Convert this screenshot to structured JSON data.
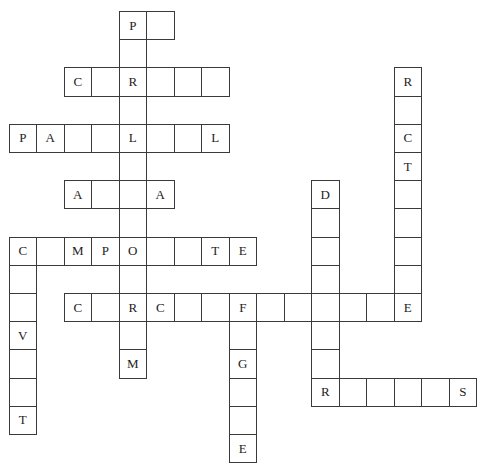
{
  "puzzle": {
    "type": "crossword",
    "grid_origin": {
      "x": 8.5,
      "y": 11
    },
    "cell_pitch": {
      "x": 27.5,
      "y": 28.2
    },
    "colors": {
      "border": "#3a3a3a",
      "text": "#222222",
      "background": "#ffffff"
    },
    "words": [
      {
        "id": "down-center",
        "direction": "down",
        "col": 4,
        "row": 0,
        "letters": [
          "P",
          "",
          "R",
          "",
          "L",
          "",
          "",
          "",
          "O",
          "",
          "R",
          "",
          "M"
        ]
      },
      {
        "id": "across-p",
        "direction": "across",
        "col": 4,
        "row": 0,
        "letters": [
          "P",
          ""
        ]
      },
      {
        "id": "across-c-r",
        "direction": "across",
        "col": 2,
        "row": 2,
        "letters": [
          "C",
          "",
          "R",
          "",
          "",
          ""
        ]
      },
      {
        "id": "across-pa-l-l",
        "direction": "across",
        "col": 0,
        "row": 4,
        "letters": [
          "P",
          "A",
          "",
          "",
          "L",
          "",
          "",
          "L"
        ]
      },
      {
        "id": "across-a-a",
        "direction": "across",
        "col": 2,
        "row": 6,
        "letters": [
          "A",
          "",
          "",
          "A"
        ]
      },
      {
        "id": "across-c-mpo-te",
        "direction": "across",
        "col": 0,
        "row": 8,
        "letters": [
          "C",
          "",
          "M",
          "P",
          "O",
          "",
          "",
          "T",
          "E"
        ]
      },
      {
        "id": "down-left",
        "direction": "down",
        "col": 0,
        "row": 8,
        "letters": [
          "C",
          "",
          "",
          "V",
          "",
          "",
          "T"
        ]
      },
      {
        "id": "across-long",
        "direction": "across",
        "col": 2,
        "row": 10,
        "letters": [
          "C",
          "",
          "R",
          "C",
          "",
          "",
          "F",
          "",
          "",
          "",
          "",
          "",
          "E"
        ]
      },
      {
        "id": "down-right",
        "direction": "down",
        "col": 14,
        "row": 2,
        "letters": [
          "R",
          "",
          "C",
          "T",
          "",
          "",
          "",
          "",
          "E"
        ]
      },
      {
        "id": "down-d",
        "direction": "down",
        "col": 11,
        "row": 6,
        "letters": [
          "D",
          "",
          "",
          "",
          "",
          "",
          "",
          "R"
        ]
      },
      {
        "id": "down-f",
        "direction": "down",
        "col": 8,
        "row": 10,
        "letters": [
          "F",
          "",
          "G",
          "",
          "",
          "E"
        ]
      },
      {
        "id": "across-r-s",
        "direction": "across",
        "col": 11,
        "row": 13,
        "letters": [
          "R",
          "",
          "",
          "",
          "",
          "S"
        ]
      }
    ]
  }
}
